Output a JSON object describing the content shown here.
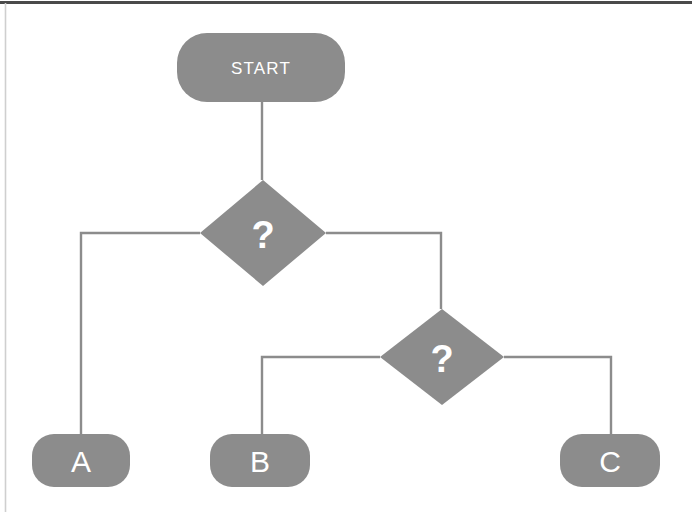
{
  "diagram": {
    "type": "flowchart",
    "title": "",
    "canvas": {
      "width": 692,
      "height": 512,
      "background": "#ffffff"
    },
    "style": {
      "node_fill": "#8c8c8c",
      "node_text_color": "#ffffff",
      "connector_color": "#8c8c8c",
      "connector_width": 2.4,
      "border_top_color": "#4a4a4a",
      "border_left_color": "#cfcfcf"
    },
    "nodes": [
      {
        "id": "start",
        "label": "START",
        "shape": "rounded-rectangle",
        "x": 177,
        "y": 33,
        "w": 168,
        "h": 69,
        "r": 30
      },
      {
        "id": "decision1",
        "label": "?",
        "shape": "diamond",
        "cx": 263,
        "cy": 233,
        "hw": 63,
        "hh": 53
      },
      {
        "id": "decision2",
        "label": "?",
        "shape": "diamond",
        "cx": 442,
        "cy": 357,
        "hw": 62,
        "hh": 48
      },
      {
        "id": "outcomeA",
        "label": "A",
        "shape": "rounded-rectangle",
        "x": 32,
        "y": 434,
        "w": 98,
        "h": 53,
        "r": 22
      },
      {
        "id": "outcomeB",
        "label": "B",
        "shape": "rounded-rectangle",
        "x": 210,
        "y": 434,
        "w": 100,
        "h": 53,
        "r": 22
      },
      {
        "id": "outcomeC",
        "label": "C",
        "shape": "rounded-rectangle",
        "x": 560,
        "y": 434,
        "w": 100,
        "h": 53,
        "r": 22
      }
    ],
    "edges": [
      {
        "id": "edge-start-decision1",
        "from": "start",
        "to": "decision1",
        "label": "",
        "path": "M 262 102 L 262 180"
      },
      {
        "id": "edge-decision1-outcomeA",
        "from": "decision1",
        "to": "outcomeA",
        "label": "",
        "path": "M 200 233 L 81 233 L 81 434"
      },
      {
        "id": "edge-decision1-decision2",
        "from": "decision1",
        "to": "decision2",
        "label": "",
        "path": "M 326 233 L 441 233 L 441 309"
      },
      {
        "id": "edge-decision2-outcomeB",
        "from": "decision2",
        "to": "outcomeB",
        "label": "",
        "path": "M 380 357 L 262 357 L 262 434"
      },
      {
        "id": "edge-decision2-outcomeC",
        "from": "decision2",
        "to": "outcomeC",
        "label": "",
        "path": "M 504 357 L 611 357 L 611 434"
      }
    ]
  }
}
